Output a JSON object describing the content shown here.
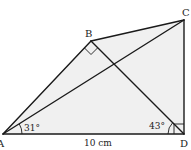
{
  "diagram": {
    "type": "geometry",
    "colors": {
      "stroke": "#1a1a1a",
      "fill": "#f0f0f0",
      "text": "#222222"
    },
    "points": {
      "A": {
        "label": "A",
        "x": 3,
        "y": 134
      },
      "B": {
        "label": "B",
        "x": 91,
        "y": 41
      },
      "C": {
        "label": "C",
        "x": 184,
        "y": 20
      },
      "D": {
        "label": "D",
        "x": 184,
        "y": 134
      }
    },
    "segments": [
      "AB",
      "BC",
      "CD",
      "DA",
      "AC",
      "BD"
    ],
    "labels": {
      "A": "A",
      "B": "B",
      "C": "C",
      "D": "D",
      "side_AD": "10 cm",
      "angle_A": "31°",
      "angle_D": "43°"
    },
    "angles": [
      {
        "vertex": "A",
        "between": [
          "AD",
          "AC"
        ],
        "value": "31°"
      },
      {
        "vertex": "D",
        "between": [
          "DA",
          "DB"
        ],
        "value": "43°"
      },
      {
        "vertex": "B",
        "between": [
          "BA",
          "BD"
        ],
        "value": "90°",
        "marker": "right-angle"
      },
      {
        "vertex": "D",
        "between": [
          "DA",
          "DC"
        ],
        "value": "90°",
        "marker": "right-angle"
      }
    ],
    "measurements": [
      {
        "segment": "AD",
        "value": "10 cm"
      }
    ]
  }
}
